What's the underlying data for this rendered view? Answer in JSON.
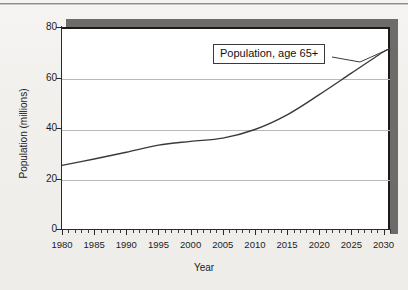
{
  "page": {
    "background_color": "#f3f1ef",
    "rule_color": "#8e8c89"
  },
  "chart_data": {
    "type": "line",
    "title": "",
    "xlabel": "Year",
    "ylabel": "Population (millions)",
    "xlim": [
      1980,
      2031
    ],
    "ylim": [
      0,
      80
    ],
    "grid": true,
    "gridlines_y": [
      20,
      40,
      60
    ],
    "legend_position": "none",
    "xticks_major": [
      1980,
      1985,
      1990,
      1995,
      2000,
      2005,
      2010,
      2015,
      2020,
      2025,
      2030
    ],
    "xtick_labels": [
      "1980",
      "1985",
      "1990",
      "1995",
      "2000",
      "2005",
      "2010",
      "2015",
      "2020",
      "2025",
      "2030"
    ],
    "xtick_minor_step": 1,
    "yticks": [
      0,
      20,
      40,
      60,
      80
    ],
    "ytick_labels": [
      "0",
      "20",
      "40",
      "60",
      "80"
    ],
    "series": [
      {
        "name": "Population, age 65+",
        "color": "#3a3a3a",
        "x": [
          1980,
          1985,
          1990,
          1995,
          2000,
          2005,
          2010,
          2015,
          2020,
          2025,
          2030,
          2031
        ],
        "values": [
          26.0,
          28.5,
          31.2,
          34.0,
          35.5,
          36.8,
          40.2,
          46.0,
          54.0,
          62.5,
          71.0,
          72.0
        ]
      }
    ],
    "annotations": [
      {
        "text": "Population, age 65+",
        "target_x": 2029,
        "target_y": 70,
        "kind": "callout-box-with-leader"
      }
    ]
  },
  "axis": {
    "y_title": "Population (millions)",
    "x_title": "Year"
  }
}
